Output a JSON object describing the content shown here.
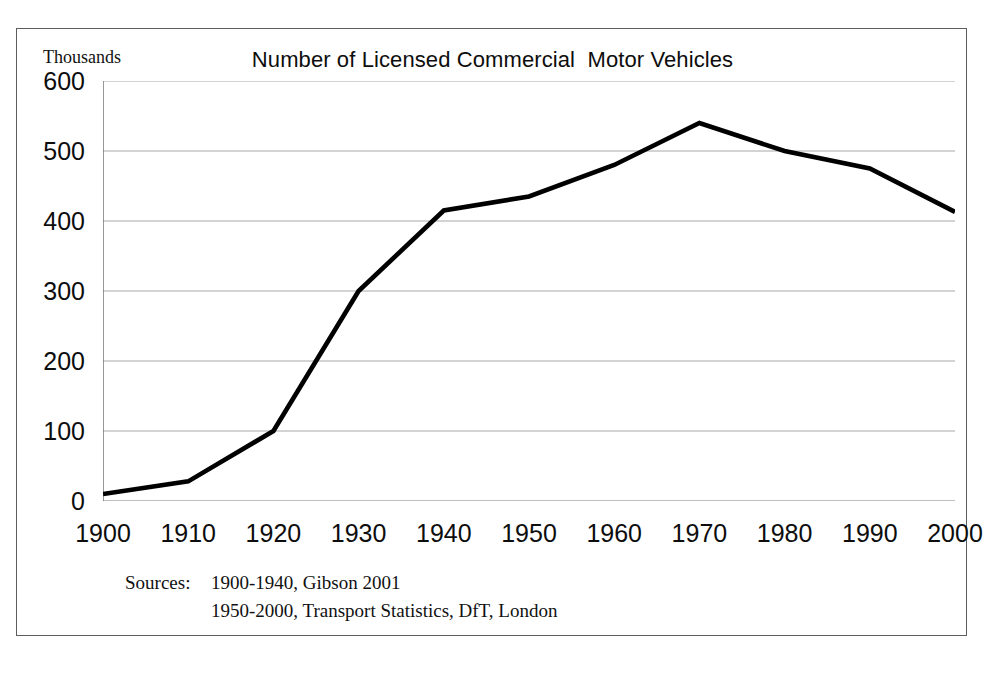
{
  "figure": {
    "unit_label": "Thousands",
    "title": "Number of Licensed Commercial  Motor Vehicles"
  },
  "sources": {
    "label": "Sources:",
    "line1": "1900-1940, Gibson 2001",
    "line2": "1950-2000, Transport Statistics, DfT, London"
  },
  "colors": {
    "line": "#000000",
    "grid": "#a8a8a8",
    "axis": "#6b6b6b",
    "frame": "#5d5d5d",
    "text": "#0d0d0d"
  },
  "chart_data": {
    "type": "line",
    "title": "Number of Licensed Commercial  Motor Vehicles",
    "xlabel": "",
    "ylabel": "Thousands",
    "xlim": [
      1900,
      2000
    ],
    "ylim": [
      0,
      600
    ],
    "grid": true,
    "legend": "none",
    "x_ticks": [
      1900,
      1910,
      1920,
      1930,
      1940,
      1950,
      1960,
      1970,
      1980,
      1990,
      2000
    ],
    "y_ticks": [
      0,
      100,
      200,
      300,
      400,
      500,
      600
    ],
    "x": [
      1900,
      1910,
      1920,
      1930,
      1940,
      1950,
      1960,
      1970,
      1980,
      1990,
      2000
    ],
    "values": [
      10,
      28,
      100,
      300,
      415,
      435,
      480,
      540,
      500,
      475,
      413
    ],
    "series": [
      {
        "name": "Licensed commercial motor vehicles",
        "values": [
          10,
          28,
          100,
          300,
          415,
          435,
          480,
          540,
          500,
          475,
          413
        ]
      }
    ]
  }
}
